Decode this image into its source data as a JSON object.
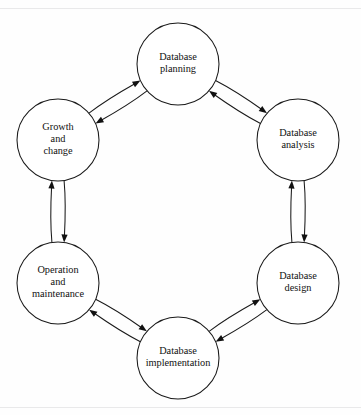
{
  "diagram": {
    "type": "cycle",
    "background_color": "#fefefe",
    "stroke_color": "#1a1a1a",
    "text_color": "#111111",
    "node_fill": "#ffffff",
    "frame_color": "#e9e9ea",
    "node_radius": 41,
    "ring_radius": 150,
    "center": {
      "x": 178,
      "y": 212
    },
    "nodes": [
      {
        "id": "database-planning",
        "lines": [
          "Database",
          "planning"
        ],
        "angle_deg": 270,
        "cx": 178,
        "cy": 64
      },
      {
        "id": "database-analysis",
        "lines": [
          "Database",
          "analysis"
        ],
        "angle_deg": 330,
        "cx": 298,
        "cy": 140
      },
      {
        "id": "database-design",
        "lines": [
          "Database",
          "design"
        ],
        "angle_deg": 30,
        "cx": 298,
        "cy": 283
      },
      {
        "id": "database-implementation",
        "lines": [
          "Database",
          "implementation"
        ],
        "angle_deg": 90,
        "cx": 178,
        "cy": 358
      },
      {
        "id": "operation-and-maintenance",
        "lines": [
          "Operation",
          "and",
          "maintenance"
        ],
        "angle_deg": 150,
        "cx": 58,
        "cy": 283
      },
      {
        "id": "growth-and-change",
        "lines": [
          "Growth",
          "and",
          "change"
        ],
        "angle_deg": 210,
        "cx": 58,
        "cy": 140
      }
    ],
    "links": [
      {
        "from": "database-planning",
        "to": "database-analysis",
        "bidirectional": true
      },
      {
        "from": "database-analysis",
        "to": "database-design",
        "bidirectional": true
      },
      {
        "from": "database-design",
        "to": "database-implementation",
        "bidirectional": true
      },
      {
        "from": "database-implementation",
        "to": "operation-and-maintenance",
        "bidirectional": true
      },
      {
        "from": "operation-and-maintenance",
        "to": "growth-and-change",
        "bidirectional": true
      },
      {
        "from": "growth-and-change",
        "to": "database-planning",
        "bidirectional": true
      }
    ]
  }
}
